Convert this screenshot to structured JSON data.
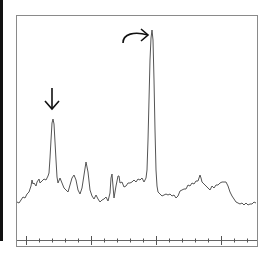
{
  "chart_data": {
    "type": "line",
    "title": "",
    "xlabel": "",
    "ylabel": "",
    "grid": false,
    "legend": null,
    "x_axis": {
      "major_ticks_px": [
        26,
        91,
        155,
        220
      ],
      "minor_tick_spacing_px": 13,
      "tick_labels": []
    },
    "annotations": [
      {
        "type": "arrow-down",
        "points_to": "secondary peak",
        "x_px": 52,
        "y_px": 110
      },
      {
        "type": "curved-arrow-right",
        "points_to": "main peak",
        "x_px": 149,
        "y_px": 35
      }
    ],
    "series": [
      {
        "name": "spectrum",
        "color": "#555555",
        "points_px": [
          [
            17,
            202
          ],
          [
            19,
            203
          ],
          [
            21,
            200
          ],
          [
            23,
            197
          ],
          [
            25,
            198
          ],
          [
            27,
            194
          ],
          [
            29,
            192
          ],
          [
            31,
            186
          ],
          [
            32,
            180
          ],
          [
            33,
            184
          ],
          [
            34,
            183
          ],
          [
            36,
            186
          ],
          [
            37,
            182
          ],
          [
            39,
            179
          ],
          [
            40,
            183
          ],
          [
            42,
            181
          ],
          [
            44,
            179
          ],
          [
            46,
            180
          ],
          [
            48,
            176
          ],
          [
            49,
            173
          ],
          [
            50,
            158
          ],
          [
            51,
            140
          ],
          [
            52,
            123
          ],
          [
            53,
            119
          ],
          [
            54,
            124
          ],
          [
            55,
            142
          ],
          [
            56,
            160
          ],
          [
            57,
            177
          ],
          [
            58,
            183
          ],
          [
            60,
            178
          ],
          [
            62,
            183
          ],
          [
            64,
            188
          ],
          [
            66,
            190
          ],
          [
            68,
            192
          ],
          [
            70,
            185
          ],
          [
            72,
            178
          ],
          [
            74,
            175
          ],
          [
            76,
            180
          ],
          [
            78,
            190
          ],
          [
            80,
            194
          ],
          [
            82,
            188
          ],
          [
            84,
            175
          ],
          [
            86,
            162
          ],
          [
            88,
            172
          ],
          [
            90,
            190
          ],
          [
            92,
            196
          ],
          [
            94,
            199
          ],
          [
            96,
            195
          ],
          [
            98,
            199
          ],
          [
            100,
            202
          ],
          [
            102,
            200
          ],
          [
            104,
            199
          ],
          [
            106,
            197
          ],
          [
            108,
            201
          ],
          [
            110,
            193
          ],
          [
            111,
            178
          ],
          [
            112,
            174
          ],
          [
            113,
            186
          ],
          [
            114,
            198
          ],
          [
            116,
            186
          ],
          [
            118,
            176
          ],
          [
            119,
            176
          ],
          [
            120,
            183
          ],
          [
            122,
            182
          ],
          [
            124,
            187
          ],
          [
            126,
            186
          ],
          [
            128,
            183
          ],
          [
            130,
            183
          ],
          [
            132,
            182
          ],
          [
            134,
            180
          ],
          [
            136,
            182
          ],
          [
            138,
            179
          ],
          [
            140,
            180
          ],
          [
            142,
            178
          ],
          [
            144,
            182
          ],
          [
            146,
            178
          ],
          [
            147,
            170
          ],
          [
            148,
            140
          ],
          [
            149,
            100
          ],
          [
            150,
            60
          ],
          [
            151,
            38
          ],
          [
            152,
            30
          ],
          [
            153,
            40
          ],
          [
            154,
            80
          ],
          [
            155,
            130
          ],
          [
            156,
            170
          ],
          [
            157,
            186
          ],
          [
            158,
            192
          ],
          [
            160,
            194
          ],
          [
            162,
            196
          ],
          [
            164,
            195
          ],
          [
            166,
            194
          ],
          [
            168,
            195
          ],
          [
            170,
            194
          ],
          [
            172,
            196
          ],
          [
            174,
            195
          ],
          [
            176,
            198
          ],
          [
            178,
            196
          ],
          [
            180,
            191
          ],
          [
            182,
            190
          ],
          [
            184,
            189
          ],
          [
            186,
            189
          ],
          [
            188,
            185
          ],
          [
            190,
            186
          ],
          [
            192,
            183
          ],
          [
            194,
            184
          ],
          [
            196,
            181
          ],
          [
            198,
            181
          ],
          [
            200,
            175
          ],
          [
            201,
            178
          ],
          [
            202,
            182
          ],
          [
            204,
            184
          ],
          [
            206,
            186
          ],
          [
            208,
            188
          ],
          [
            210,
            190
          ],
          [
            212,
            186
          ],
          [
            214,
            188
          ],
          [
            216,
            185
          ],
          [
            218,
            185
          ],
          [
            220,
            183
          ],
          [
            222,
            182
          ],
          [
            224,
            182
          ],
          [
            226,
            182
          ],
          [
            228,
            186
          ],
          [
            230,
            192
          ],
          [
            232,
            196
          ],
          [
            234,
            199
          ],
          [
            236,
            202
          ],
          [
            238,
            203
          ],
          [
            240,
            204
          ],
          [
            242,
            203
          ],
          [
            244,
            205
          ],
          [
            246,
            203
          ],
          [
            248,
            205
          ],
          [
            250,
            204
          ],
          [
            252,
            204
          ],
          [
            254,
            202
          ],
          [
            256,
            203
          ]
        ]
      }
    ],
    "peaks": [
      {
        "label": "main peak",
        "x_px": 152,
        "y_px": 30
      },
      {
        "label": "secondary peak",
        "x_px": 53,
        "y_px": 119
      }
    ]
  }
}
